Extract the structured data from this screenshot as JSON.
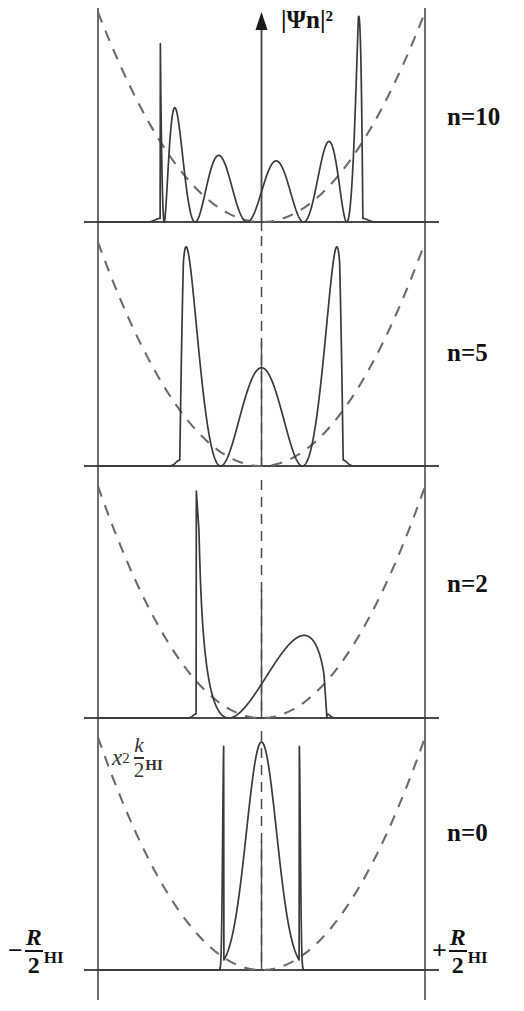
{
  "figure": {
    "y_axis_label": "|Ψn|²",
    "left_end_label": {
      "sign": "−",
      "numerator": "R",
      "subscript": "HI",
      "denominator": "2"
    },
    "right_end_label": {
      "sign": "+",
      "numerator": "R",
      "subscript": "HI",
      "denominator": "2"
    },
    "potential_annotation": {
      "x_symbol": "x",
      "exponent": "2",
      "k_symbol": "k",
      "k_subscript": "HI",
      "denominator": "2"
    },
    "panels": [
      {
        "label": "n=10",
        "n": 10
      },
      {
        "label": "n=5",
        "n": 5
      },
      {
        "label": "n=2",
        "n": 2
      },
      {
        "label": "n=0",
        "n": 0
      }
    ],
    "colors": {
      "curve": "#3a3a3a",
      "potential": "#6b6b6b",
      "axis": "#4a4a4a",
      "text": "#111111"
    }
  },
  "chart_data": {
    "type": "line",
    "title": "",
    "xlabel": "",
    "ylabel": "|Ψn|²",
    "xlim": [
      -1,
      1
    ],
    "x_tick_labels": [
      "−R_HI/2",
      "+R_HI/2"
    ],
    "grid": false,
    "legend": "none",
    "annotations": [
      "x² k_HI/2"
    ],
    "panels": [
      {
        "name": "n=10",
        "quantum_number": 10,
        "peak_count": 11,
        "peak_x": [
          -0.545,
          -0.445,
          -0.35,
          -0.257,
          -0.167,
          -0.08,
          0.0,
          0.08,
          0.167,
          0.257,
          0.35,
          0.445,
          0.545
        ],
        "peak_heights": [
          1.0,
          0.62,
          0.53,
          0.47,
          0.45,
          0.44,
          0.47,
          0.44,
          0.45,
          0.47,
          0.53,
          0.62,
          1.0
        ],
        "envelope": "classical turning points at x=±0.58",
        "potential_curve": "parabolic dashed, V = x^2 k_HI/2"
      },
      {
        "name": "n=5",
        "quantum_number": 5,
        "peak_count": 6,
        "peak_x": [
          -0.4,
          -0.245,
          -0.095,
          0.065,
          0.215,
          0.375
        ],
        "peak_heights": [
          1.0,
          0.62,
          0.55,
          0.55,
          0.63,
          1.0
        ],
        "potential_curve": "parabolic dashed, V = x^2 k_HI/2"
      },
      {
        "name": "n=2",
        "quantum_number": 2,
        "peak_count": 3,
        "peak_x": [
          -0.24,
          0.0,
          0.24
        ],
        "peak_heights": [
          0.95,
          0.72,
          0.95
        ],
        "potential_curve": "parabolic dashed, V = x^2 k_HI/2"
      },
      {
        "name": "n=0",
        "quantum_number": 0,
        "peak_count": 1,
        "peak_x": [
          0.0
        ],
        "peak_heights": [
          1.0
        ],
        "potential_curve": "parabolic dashed, V = x^2 k_HI/2"
      }
    ]
  }
}
